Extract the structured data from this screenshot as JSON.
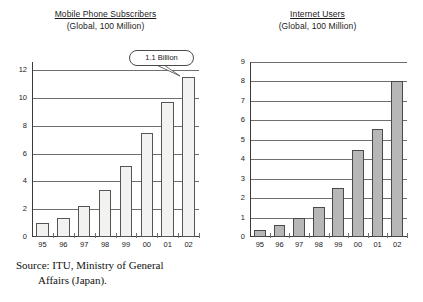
{
  "chart_data": [
    {
      "type": "bar",
      "title": "Mobile Phone Subscribers",
      "subtitle": "(Global, 100 Million)",
      "xlabel": "",
      "ylabel": "",
      "categories": [
        "95",
        "96",
        "97",
        "98",
        "99",
        "00",
        "01",
        "02"
      ],
      "values": [
        1.0,
        1.35,
        2.2,
        3.4,
        5.1,
        7.5,
        9.7,
        11.55
      ],
      "yticks": [
        0,
        2,
        4,
        6,
        8,
        10,
        12
      ],
      "ylim": [
        0,
        12.6
      ],
      "grid": true,
      "legend": "none",
      "bar_style": "outline",
      "annotations": [
        {
          "text": "1.1 Billion",
          "points_to_category": "02"
        }
      ],
      "source": {
        "line1": "Source: ITU, Ministry of General",
        "line2": "Affairs (Japan)."
      }
    },
    {
      "type": "bar",
      "title": "Internet Users",
      "subtitle": "(Global, 100 Million)",
      "xlabel": "",
      "ylabel": "",
      "categories": [
        "95",
        "96",
        "97",
        "98",
        "99",
        "00",
        "01",
        "02"
      ],
      "values": [
        0.38,
        0.6,
        1.0,
        1.55,
        2.5,
        4.5,
        5.55,
        8.0
      ],
      "yticks": [
        0,
        1,
        2,
        3,
        4,
        5,
        6,
        7,
        8,
        9
      ],
      "ylim": [
        0,
        9.0
      ],
      "grid": true,
      "legend": "none",
      "bar_style": "filled",
      "annotations": [],
      "source": {
        "line1": "Source: NUA Internet survey.",
        "line2": ""
      }
    }
  ],
  "colors": {
    "bar_fill_left": "#f2f2f0",
    "bar_fill_right": "#b7b7b7",
    "bar_stroke": "#4a4a4a",
    "gridline": "#6f6f6f",
    "axis": "#3a3a3a",
    "text": "#1a1a1a",
    "background": "#ffffff"
  }
}
